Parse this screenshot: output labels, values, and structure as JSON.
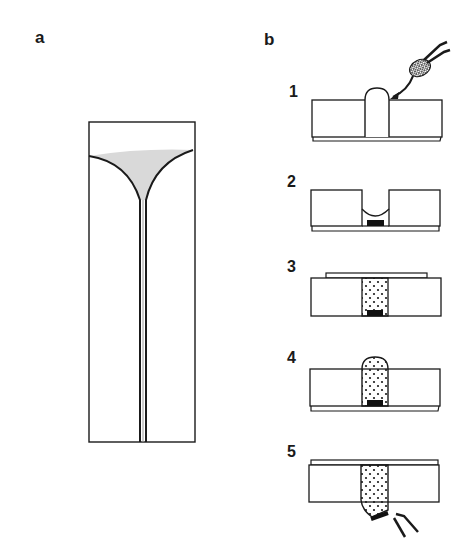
{
  "figure": {
    "panels": [
      {
        "id": "a",
        "label": "a",
        "description": "Chamber with funnel-shaped gel and narrow channel"
      },
      {
        "id": "b",
        "label": "b",
        "description": "Five-step sample loading and extraction procedure"
      }
    ],
    "steps": [
      {
        "number": "1",
        "description": "Droplet held by forceps is placed into well; meniscus bulges above slab"
      },
      {
        "number": "2",
        "description": "Well with concave meniscus and dark pellet at bottom"
      },
      {
        "number": "3",
        "description": "Cover slip placed on top; well filled with dotted material, pellet at bottom"
      },
      {
        "number": "4",
        "description": "Dotted material bulges above the well; pellet at bottom"
      },
      {
        "number": "5",
        "description": "Cover slip on top; dotted plug pushed out of bottom, pellet removed by forceps"
      }
    ],
    "colors": {
      "line": "#1a1a1a",
      "gel_fill": "#d9d9d9",
      "pellet": "#111111",
      "background": "#ffffff"
    }
  }
}
